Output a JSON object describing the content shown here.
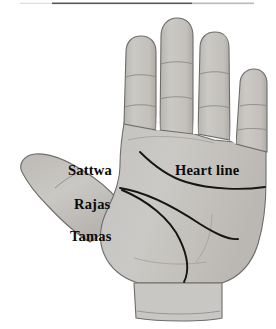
{
  "figure": {
    "type": "anatomical-line-diagram",
    "background_color": "#ffffff",
    "skin_fill_color": "#c8c6c2",
    "skin_shadow_color": "#b4b1ac",
    "outline_color": "#6e6c69",
    "crease_color": "#8a8884",
    "marked_line_color": "#151515",
    "text_color": "#0a0a0a",
    "top_rule_color": "#3a3a3a"
  },
  "labels": {
    "sattwa": "Sattwa",
    "rajas": "Rajas",
    "tamas": "Tamas",
    "heart_line": "Heart line"
  },
  "annotations": [
    {
      "id": "sattwa",
      "text": "Sattwa",
      "side": "left",
      "points_to": "upper thumb phalanx / upper palm zone"
    },
    {
      "id": "rajas",
      "text": "Rajas",
      "side": "left",
      "points_to": "middle thumb zone / mid palm zone"
    },
    {
      "id": "tamas",
      "text": "Tamas",
      "side": "left",
      "points_to": "thumb base / lower palm zone"
    },
    {
      "id": "heart-line",
      "text": "Heart line",
      "side": "right",
      "points_to": "uppermost drawn palm crease"
    }
  ],
  "marked_lines": [
    {
      "id": "heart-line",
      "name": "Heart line",
      "description": "Upper dark curve beginning below the index finger and sweeping right to the outer palm edge"
    },
    {
      "id": "upper-fan-line",
      "name": "Upper fan line",
      "description": "Dark line from the left palm edge sweeping down-right toward the lower outer palm"
    },
    {
      "id": "lower-fan-line",
      "name": "Lower fan line",
      "description": "Dark line from the left palm edge curving down around the thumb mount to the wrist"
    }
  ]
}
